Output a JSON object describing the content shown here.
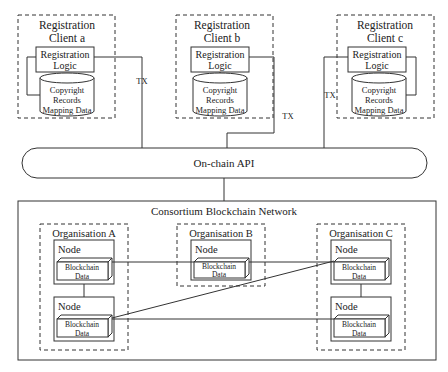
{
  "clients": [
    {
      "title_line1": "Registration",
      "title_line2": "Client a",
      "logic_line1": "Registration",
      "logic_line2": "Logic",
      "db_line1": "Copyright",
      "db_line2": "Records",
      "db_line3": "Mapping Data",
      "tx_label": "TX"
    },
    {
      "title_line1": "Registration",
      "title_line2": "Client b",
      "logic_line1": "Registration",
      "logic_line2": "Logic",
      "db_line1": "Copyright",
      "db_line2": "Records",
      "db_line3": "Mapping Data",
      "tx_label": "TX"
    },
    {
      "title_line1": "Registration",
      "title_line2": "Client c",
      "logic_line1": "Registration",
      "logic_line2": "Logic",
      "db_line1": "Copyright",
      "db_line2": "Records",
      "db_line3": "Mapping Data",
      "tx_label": "TX"
    }
  ],
  "api": {
    "label": "On-chain API"
  },
  "network": {
    "title": "Consortium Blockchain Network",
    "organisations": [
      {
        "label": "Organisation A",
        "nodes": [
          {
            "label": "Node",
            "data_line1": "Blockchain",
            "data_line2": "Data"
          },
          {
            "label": "Node",
            "data_line1": "Blockchain",
            "data_line2": "Data"
          }
        ]
      },
      {
        "label": "Organisation B",
        "nodes": [
          {
            "label": "Node",
            "data_line1": "Blockchain",
            "data_line2": "Data"
          }
        ]
      },
      {
        "label": "Organisation C",
        "nodes": [
          {
            "label": "Node",
            "data_line1": "Blockchain",
            "data_line2": "Data"
          },
          {
            "label": "Node",
            "data_line1": "Blockchain",
            "data_line2": "Data"
          }
        ]
      }
    ]
  }
}
